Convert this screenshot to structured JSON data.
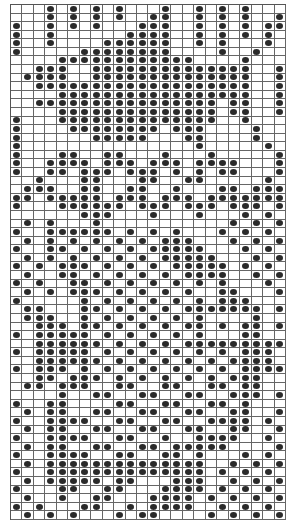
{
  "pattern": {
    "columns": 24,
    "rows": 60,
    "dot_color": "#2a2a2a",
    "grid_line_color": "#666666",
    "background": "#ffffff",
    "legend": {
      "1": "dot (filled stitch)",
      "0": "empty cell"
    },
    "cells": [
      "000101010100010010101000",
      "000101010100110010101001",
      "100101010001110010101011",
      "100100000011110010101010",
      "100100001111110010100010",
      "100000111111110000100100",
      "000011111111111100001000",
      "001110011111111111111001",
      "011110011111111111111001",
      "001111111111111111111001",
      "000011111111111111111001",
      "001111111111111111011001",
      "000011111111111111011001",
      "100011111111111111001000",
      "100001111111101110000100",
      "100000011111000110000100",
      "100000000000000010000010",
      "100011001100010001000001",
      "100111101110111011110001",
      "100110111011101010110001",
      "001000110001100110000010",
      "011100110011001000110111",
      "110111110111011101111111",
      "100011111101110111011101",
      "000000111000100010001010",
      "010100010000000000010101",
      "100111111010101000101010",
      "010101010101011100010101",
      "100110101010111110001010",
      "010101010101011111000101",
      "101011101010101111101010",
      "010011010101010111100101",
      "101001101010101010100010",
      "010101110101010100110001",
      "100000101010101010111000",
      "011000110101010111111101",
      "011100101010101010000100",
      "001110110101010110101101",
      "101111101010101010001100",
      "001111110101010111111111",
      "101111101010101010101110",
      "001111110101010101011110",
      "101110101010101010101111",
      "001101110101010101011100",
      "011011100110011001101100",
      "000010011001100110011101",
      "100110000110011001101000",
      "010110011001100110011001",
      "100111100110011001111010",
      "010110011001100110011001",
      "100111100110010011110010",
      "010110011001101111100001",
      "100111100110011010001010",
      "010111111111111110010101",
      "100111111111111110101010",
      "010111110110001110010101",
      "100011001100011110101010",
      "010010011000111101010101",
      "101000110010111100101010",
      "010101000101100001010101"
    ]
  }
}
